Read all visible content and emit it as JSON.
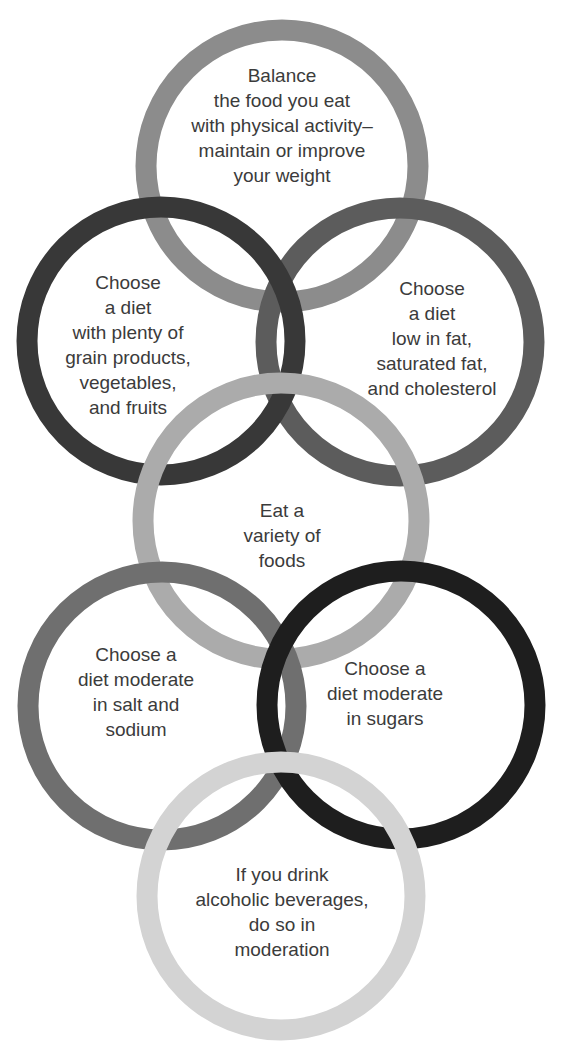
{
  "diagram": {
    "type": "overlapping-rings",
    "rings": [
      {
        "id": "balance",
        "cx": 282,
        "cy": 166,
        "r": 136,
        "color": "#8c8c8c",
        "label": "Balance\nthe food you eat\nwith physical activity–\nmaintain or improve\nyour weight",
        "label_x": 282,
        "label_y": 125
      },
      {
        "id": "low-fat",
        "cx": 400,
        "cy": 342,
        "r": 134,
        "color": "#5c5c5c",
        "label": "Choose\na diet\nlow in fat,\nsaturated fat,\nand cholesterol",
        "label_x": 432,
        "label_y": 338
      },
      {
        "id": "grain",
        "cx": 161,
        "cy": 341,
        "r": 134,
        "color": "#383838",
        "label": "Choose\na diet\nwith plenty of\ngrain products,\nvegetables,\nand fruits",
        "label_x": 128,
        "label_y": 345
      },
      {
        "id": "variety",
        "cx": 281,
        "cy": 521,
        "r": 138,
        "color": "#ababab",
        "label": "Eat a\nvariety of\nfoods",
        "label_x": 282,
        "label_y": 535
      },
      {
        "id": "salt",
        "cx": 162,
        "cy": 706,
        "r": 134,
        "color": "#6f6f6f",
        "label": "Choose a\ndiet moderate\nin salt and\nsodium",
        "label_x": 136,
        "label_y": 692
      },
      {
        "id": "sugars",
        "cx": 401,
        "cy": 705,
        "r": 134,
        "color": "#1e1e1e",
        "label": "Choose a\ndiet moderate\nin sugars",
        "label_x": 385,
        "label_y": 693
      },
      {
        "id": "alcohol",
        "cx": 281,
        "cy": 896,
        "r": 134,
        "color": "#d3d3d3",
        "label": "If you drink\nalcoholic beverages,\ndo so in\nmoderation",
        "label_x": 282,
        "label_y": 912
      }
    ]
  }
}
